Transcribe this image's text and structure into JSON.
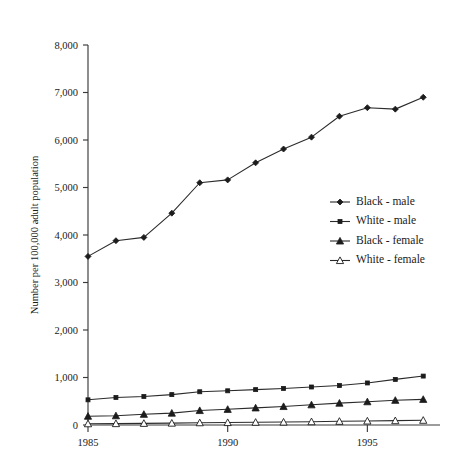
{
  "chart_data": {
    "type": "line",
    "title": "",
    "xlabel": "",
    "ylabel": "Number per 100,000 adult population",
    "xlim": [
      1985,
      1997.6
    ],
    "ylim": [
      0,
      8000
    ],
    "grid": false,
    "legend_position": "center-right",
    "x": [
      1985,
      1986,
      1987,
      1988,
      1989,
      1990,
      1991,
      1992,
      1993,
      1994,
      1995,
      1996,
      1997
    ],
    "xticks": [
      1985,
      1990,
      1995
    ],
    "xtick_labels": [
      "1985",
      "1990",
      "1995"
    ],
    "yticks": [
      0,
      1000,
      2000,
      3000,
      4000,
      5000,
      6000,
      7000,
      8000
    ],
    "ytick_labels": [
      "0",
      "1,000",
      "2,000",
      "3,000",
      "4,000",
      "5,000",
      "6,000",
      "7,000",
      "8,000"
    ],
    "series": [
      {
        "name": "Black - male",
        "marker": "filled-diamond",
        "values": [
          3550,
          3880,
          3950,
          4460,
          5100,
          5160,
          5520,
          5810,
          6060,
          6500,
          6680,
          6650,
          6900
        ]
      },
      {
        "name": "White - male",
        "marker": "filled-square",
        "values": [
          530,
          580,
          600,
          640,
          700,
          720,
          745,
          770,
          800,
          830,
          885,
          960,
          1030
        ]
      },
      {
        "name": "Black - female",
        "marker": "filled-triangle",
        "values": [
          185,
          195,
          225,
          250,
          305,
          330,
          360,
          390,
          425,
          460,
          490,
          520,
          540
        ]
      },
      {
        "name": "White - female",
        "marker": "open-triangle",
        "values": [
          27,
          30,
          35,
          40,
          48,
          52,
          58,
          62,
          70,
          78,
          85,
          92,
          100
        ]
      }
    ]
  },
  "legend": {
    "items": [
      {
        "label": "Black - male"
      },
      {
        "label": "White - male"
      },
      {
        "label": "Black - female"
      },
      {
        "label": "White - female"
      }
    ]
  },
  "colors": {
    "line": "#2b2b2b",
    "axis": "#3a3a3a",
    "text": "#1a1a1a",
    "background": "#ffffff"
  }
}
